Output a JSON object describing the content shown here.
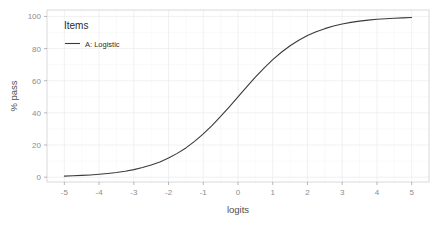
{
  "chart_data": {
    "type": "line",
    "title": "",
    "xlabel": "logits",
    "ylabel": "% pass",
    "xlim": [
      -5.5,
      5.5
    ],
    "ylim": [
      -3,
      104
    ],
    "xticks": [
      -5,
      -4,
      -3,
      -2,
      -1,
      0,
      1,
      2,
      3,
      4,
      5
    ],
    "xtick_labels": [
      "-5",
      "-4",
      "-3",
      "-2",
      "-1",
      "0",
      "1",
      "2",
      "3",
      "4",
      "5"
    ],
    "yticks": [
      0,
      20,
      40,
      60,
      80,
      100
    ],
    "ytick_labels": [
      "0",
      "20",
      "40",
      "60",
      "80",
      "100"
    ],
    "grid": true,
    "grid_minor": true,
    "legend": {
      "title": "Items",
      "position": "inside-top-left",
      "entries": [
        {
          "label": "A: Logistic",
          "color": "#3b3b3b",
          "marker": "line"
        }
      ]
    },
    "series": [
      {
        "name": "A: Logistic",
        "color": "#3b3b3b",
        "x": [
          -5,
          -4.75,
          -4.5,
          -4.25,
          -4,
          -3.75,
          -3.5,
          -3.25,
          -3,
          -2.75,
          -2.5,
          -2.25,
          -2,
          -1.75,
          -1.5,
          -1.25,
          -1,
          -0.75,
          -0.5,
          -0.25,
          0,
          0.25,
          0.5,
          0.75,
          1,
          1.25,
          1.5,
          1.75,
          2,
          2.25,
          2.5,
          2.75,
          3,
          3.25,
          3.5,
          3.75,
          4,
          4.25,
          4.5,
          4.75,
          5
        ],
        "y": [
          0.67,
          0.86,
          1.1,
          1.4,
          1.8,
          2.3,
          2.9,
          3.7,
          4.7,
          6.0,
          7.6,
          9.5,
          11.9,
          14.8,
          18.2,
          22.3,
          26.9,
          32.1,
          37.8,
          43.8,
          50.0,
          56.2,
          62.2,
          67.9,
          73.1,
          77.7,
          81.8,
          85.2,
          88.1,
          90.5,
          92.4,
          94.0,
          95.3,
          96.3,
          97.1,
          97.7,
          98.2,
          98.6,
          98.9,
          99.1,
          99.3
        ]
      }
    ]
  }
}
